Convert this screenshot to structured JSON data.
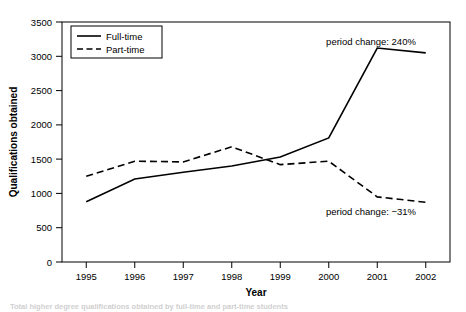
{
  "chart_data": {
    "type": "line",
    "title": "",
    "xlabel": "Year",
    "ylabel": "Qualifications obtained",
    "categories": [
      "1995",
      "1996",
      "1997",
      "1998",
      "1999",
      "2000",
      "2001",
      "2002"
    ],
    "x": [
      1995,
      1996,
      1997,
      1998,
      1999,
      2000,
      2001,
      2002
    ],
    "ylim": [
      0,
      3500
    ],
    "ytick_labels": [
      "0",
      "500",
      "1000",
      "1500",
      "2000",
      "2500",
      "3000",
      "3500"
    ],
    "ytick_values": [
      0,
      500,
      1000,
      1500,
      2000,
      2500,
      3000,
      3500
    ],
    "grid": false,
    "legend_position": "top-left",
    "series": [
      {
        "name": "Full-time",
        "style": "solid",
        "color": "#000000",
        "values": [
          880,
          1210,
          1310,
          1400,
          1530,
          1810,
          3120,
          3050
        ]
      },
      {
        "name": "Part-time",
        "style": "dashed",
        "color": "#000000",
        "values": [
          1250,
          1470,
          1460,
          1680,
          1420,
          1470,
          950,
          870
        ]
      }
    ],
    "annotations": [
      {
        "text": "period change: 240%",
        "series": "Full-time",
        "x": 2000.55,
        "y": 3340
      },
      {
        "text": "period change: −31%",
        "series": "Part-time",
        "x": 2000.6,
        "y": 690
      }
    ]
  },
  "caption": {
    "text": "Total higher degree qualifications obtained by full-time and part-time students"
  }
}
